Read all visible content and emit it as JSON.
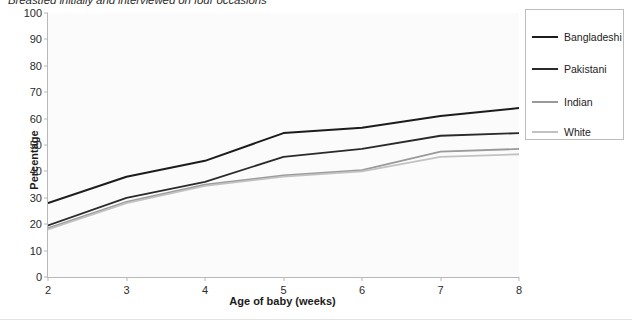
{
  "chart_data": {
    "type": "line",
    "title": "Breastfed initially and interviewed on four occasions",
    "xlabel": "Age of baby (weeks)",
    "ylabel": "Percentage",
    "x": [
      2,
      3,
      4,
      5,
      6,
      7,
      8
    ],
    "xlim": [
      2,
      8
    ],
    "ylim": [
      0,
      100
    ],
    "xticks": [
      "2",
      "3",
      "4",
      "5",
      "6",
      "7",
      "8"
    ],
    "yticks": [
      "0",
      "10",
      "20",
      "30",
      "40",
      "50",
      "60",
      "70",
      "80",
      "90",
      "100"
    ],
    "grid": false,
    "legend_position": "top-right",
    "series": [
      {
        "name": "Bangladeshi",
        "color": "#1c1c1c",
        "width": 2.0,
        "values": [
          28,
          38,
          44,
          54.5,
          56.5,
          61,
          64
        ]
      },
      {
        "name": "Pakistani",
        "color": "#2a2a2a",
        "width": 1.8,
        "values": [
          19.5,
          30,
          36,
          45.5,
          48.5,
          53.5,
          54.5
        ]
      },
      {
        "name": "Indian",
        "color": "#9a9a9a",
        "width": 1.8,
        "values": [
          18.5,
          28.5,
          35,
          38.5,
          40.5,
          47.5,
          48.5
        ]
      },
      {
        "name": "White",
        "color": "#c2c2c2",
        "width": 1.8,
        "values": [
          18,
          28,
          34.5,
          38,
          40,
          45.5,
          46.5
        ]
      }
    ]
  }
}
